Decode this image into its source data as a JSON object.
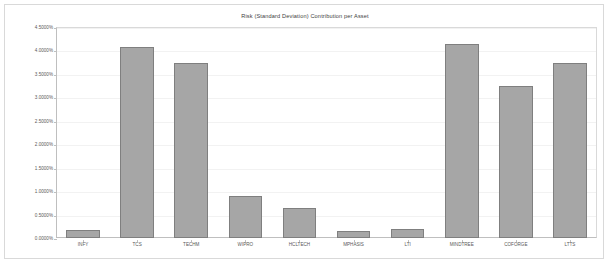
{
  "chart_data": {
    "type": "bar",
    "title": "Risk (Standard Deviation) Contribution per Asset",
    "xlabel": "",
    "ylabel": "",
    "grid": true,
    "legend": false,
    "ylim": [
      0,
      4.5
    ],
    "ytick_format": "percent_4dp",
    "categories": [
      "INFY",
      "TCS",
      "TECHM",
      "WIPRO",
      "HCLTECH",
      "MPHASIS",
      "LTI",
      "MINDTREE",
      "COFORGE",
      "LTTS"
    ],
    "values": [
      0.17,
      4.08,
      3.73,
      0.9,
      0.63,
      0.15,
      0.2,
      4.13,
      3.25,
      3.73
    ],
    "ytick_labels": [
      "0.0000%",
      "0.5000%",
      "1.0000%",
      "1.5000%",
      "2.0000%",
      "2.5000%",
      "3.0000%",
      "3.5000%",
      "4.0000%",
      "4.5000%"
    ],
    "ytick_values": [
      0,
      0.5,
      1.0,
      1.5,
      2.0,
      2.5,
      3.0,
      3.5,
      4.0,
      4.5
    ],
    "series": [
      {
        "name": "Risk Contribution",
        "values": [
          0.17,
          4.08,
          3.73,
          0.9,
          0.63,
          0.15,
          0.2,
          4.13,
          3.25,
          3.73
        ]
      }
    ],
    "colors": {
      "bar_fill": "#a6a6a6",
      "bar_border": "#7f7f7f",
      "axis": "#bfbfbf",
      "grid": "#f2f2f2",
      "text": "#595959",
      "title": "#404040",
      "background": "#ffffff",
      "frame": "#d9d9d9"
    }
  }
}
